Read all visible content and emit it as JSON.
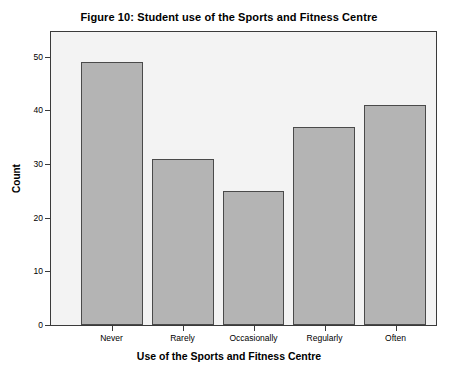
{
  "chart_data": {
    "type": "bar",
    "title": "Figure 10: Student use of the Sports and Fitness Centre",
    "xlabel": "Use of the Sports and Fitness Centre",
    "ylabel": "Count",
    "categories": [
      "Never",
      "Rarely",
      "Occasionally",
      "Regularly",
      "Often"
    ],
    "values": [
      49,
      31,
      25,
      37,
      41
    ],
    "ylim": [
      0,
      55
    ],
    "yticks": [
      0,
      10,
      20,
      30,
      40,
      50
    ],
    "ytick_labels": [
      "0",
      "10",
      "20",
      "30",
      "40",
      "50"
    ],
    "grid": false,
    "legend": "none",
    "colors": {
      "bar_fill": "#b4b4b4",
      "bar_edge": "#4a4a4a",
      "plot_background": "#f3f3f3",
      "frame": "#3a3a3a",
      "text": "#000000",
      "page_background": "#ffffff"
    }
  }
}
